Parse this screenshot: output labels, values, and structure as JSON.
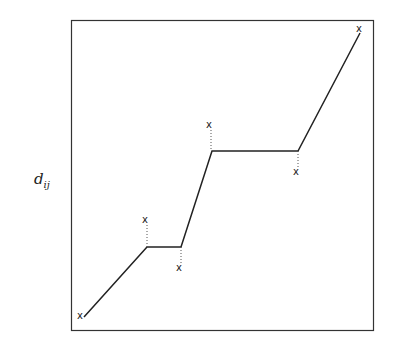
{
  "chart_data": {
    "type": "line",
    "title": "",
    "xlabel": "",
    "ylabel": "d_ij",
    "ylabel_main": "d",
    "ylabel_sub": "ij",
    "grid": false,
    "legend": null,
    "fit_line": [
      [
        84,
        317
      ],
      [
        147,
        247
      ],
      [
        181,
        247
      ],
      [
        212,
        151
      ],
      [
        298,
        151
      ],
      [
        360,
        33
      ]
    ],
    "points": [
      {
        "x": 80,
        "y": 316
      },
      {
        "x": 145,
        "y": 220,
        "fit_y": 247
      },
      {
        "x": 179,
        "y": 268,
        "fit_y": 247
      },
      {
        "x": 209,
        "y": 125,
        "fit_y": 151
      },
      {
        "x": 296,
        "y": 172,
        "fit_y": 151
      },
      {
        "x": 359,
        "y": 29
      }
    ]
  }
}
